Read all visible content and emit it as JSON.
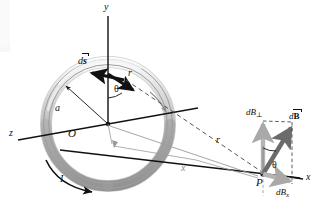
{
  "figure": {
    "background_color": "#ffffff",
    "width": 324,
    "height": 208
  },
  "colors": {
    "ink": "#111111",
    "ring_light": "#e8e8e8",
    "ring_mid": "#b8b8b8",
    "ring_dark": "#8f8f8f",
    "gray_arrow": "#a9a9a9",
    "gray_line": "#9b9b9b",
    "dashed": "#6f6f6f"
  },
  "axes": [
    {
      "id": "y-axis",
      "label": "y",
      "x": 108,
      "y": 10,
      "direction": "up"
    },
    {
      "id": "z-axis",
      "label": "z",
      "x": 11,
      "y": 134,
      "direction": "down-left"
    },
    {
      "id": "x-axis",
      "label": "x",
      "x": 308,
      "y": 180,
      "direction": "down-right"
    }
  ],
  "labels": {
    "origin": "O",
    "radius": "a",
    "current": "I",
    "ds_d": "d",
    "ds_s": "s",
    "r_ring": "r",
    "r_dashed": "r",
    "theta_ring": "θ",
    "theta_point": "θ",
    "axial_distance": "x",
    "point_p": "P",
    "dB_perp_d": "d",
    "dB_perp_B": "B",
    "dB_perp_sub": "⊥",
    "dB_vec_d": "d",
    "dB_vec_B": "B",
    "dB_x_d": "d",
    "dB_x_B": "B",
    "dB_x_sub": "x"
  },
  "label_positions": {
    "y": {
      "x": 105,
      "y": 4
    },
    "z": {
      "x": 10,
      "y": 128
    },
    "x_axis": {
      "x": 307,
      "y": 175
    },
    "origin": {
      "x": 69,
      "y": 130
    },
    "radius": {
      "x": 55,
      "y": 108
    },
    "current": {
      "x": 60,
      "y": 178
    },
    "ds": {
      "x": 79,
      "y": 61
    },
    "r_ring": {
      "x": 127,
      "y": 69
    },
    "theta_ring": {
      "x": 114,
      "y": 86
    },
    "r_dashed": {
      "x": 216,
      "y": 140
    },
    "axial_distance": {
      "x": 182,
      "y": 168
    },
    "point_p": {
      "x": 258,
      "y": 180
    },
    "theta_point": {
      "x": 272,
      "y": 167
    },
    "dB_perp": {
      "x": 248,
      "y": 110
    },
    "dB_vec": {
      "x": 290,
      "y": 117
    },
    "dB_x": {
      "x": 277,
      "y": 190
    }
  },
  "geometry": {
    "ring": {
      "center_x": 108,
      "center_y": 124,
      "radius_x": 62,
      "radius_y": 62,
      "tube_thickness": 9,
      "description": "torus-like current loop shown in gray shading"
    },
    "point_p": {
      "x": 263,
      "y": 174
    },
    "vectors": [
      {
        "name": "dB-perp-vector",
        "from": [
          263,
          174
        ],
        "to": [
          263,
          120
        ],
        "color": "#a9a9a9",
        "style": "thick-gray"
      },
      {
        "name": "dB-vector",
        "from": [
          263,
          174
        ],
        "to": [
          290,
          125
        ],
        "color": "#6b6b6b",
        "style": "thick-dark"
      },
      {
        "name": "dB-x-vector",
        "from": [
          263,
          174
        ],
        "to": [
          290,
          182
        ],
        "color": "#a9a9a9",
        "style": "thick-gray"
      },
      {
        "name": "ds-vector",
        "from": [
          122,
          79
        ],
        "to": [
          89,
          73
        ],
        "color": "#111111",
        "style": "bold-black"
      },
      {
        "name": "r-vector-ring",
        "from": [
          108,
          74
        ],
        "to": [
          135,
          92
        ],
        "color": "#111111",
        "style": "bold-black"
      },
      {
        "name": "radius-a-vector",
        "from": [
          108,
          124
        ],
        "to": [
          64,
          84
        ],
        "color": "#111111",
        "style": "thin-black"
      },
      {
        "name": "r-dashed-line",
        "from": [
          122,
          79
        ],
        "to": [
          263,
          174
        ],
        "color": "#6f6f6f",
        "style": "dashed"
      },
      {
        "name": "x-distance-line",
        "from": [
          108,
          124
        ],
        "to": [
          263,
          174
        ],
        "color": "#9b9b9b",
        "style": "thin-gray"
      },
      {
        "name": "current-arc-arrow",
        "from": [
          48,
          165
        ],
        "to": [
          95,
          190
        ],
        "color": "#111111",
        "style": "curved"
      }
    ]
  }
}
